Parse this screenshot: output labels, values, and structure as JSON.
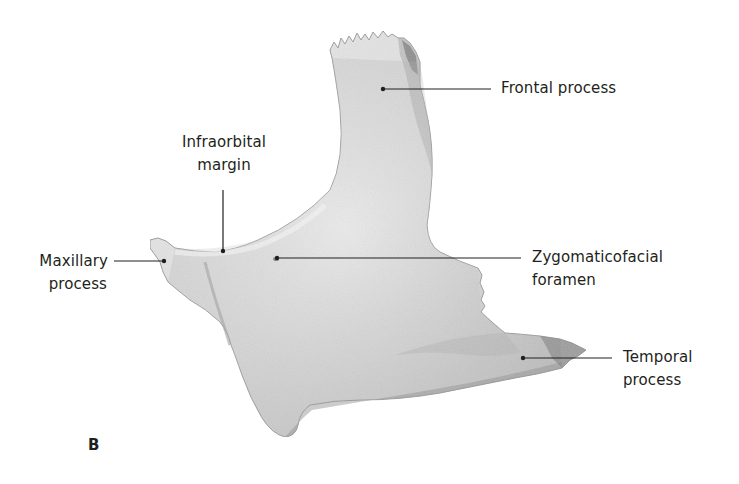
{
  "figure": {
    "panel_letter": "B",
    "labels": [
      {
        "id": "frontal-process",
        "lines": [
          "Frontal process"
        ]
      },
      {
        "id": "infraorbital-margin",
        "lines": [
          "Infraorbital",
          "margin"
        ]
      },
      {
        "id": "maxillary-process",
        "lines": [
          "Maxillary",
          "process"
        ]
      },
      {
        "id": "zygomaticofacial-foramen",
        "lines": [
          "Zygomaticofacial",
          "foramen"
        ]
      },
      {
        "id": "temporal-process",
        "lines": [
          "Temporal",
          "process"
        ]
      }
    ],
    "colors": {
      "text": "#231f20",
      "leader_line": "#231f20",
      "bone_light": "#ececec",
      "bone_mid": "#d2d2d2",
      "bone_shadow": "#9a9a9a",
      "background": "#ffffff"
    }
  }
}
